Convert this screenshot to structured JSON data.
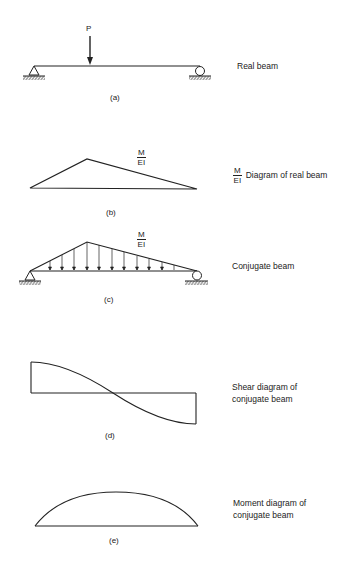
{
  "figure": {
    "panels": [
      {
        "id": "a",
        "caption": "(a)",
        "label": "Real beam",
        "load_label": "P"
      },
      {
        "id": "b",
        "caption": "(b)",
        "label_fraction": {
          "numerator": "M",
          "denominator": "EI"
        },
        "label": "Diagram of real beam",
        "diagram_fraction": {
          "numerator": "M",
          "denominator": "EI"
        }
      },
      {
        "id": "c",
        "caption": "(c)",
        "label": "Conjugate beam",
        "diagram_fraction": {
          "numerator": "M",
          "denominator": "EI"
        }
      },
      {
        "id": "d",
        "caption": "(d)",
        "label_line1": "Shear diagram of",
        "label_line2": "conjugate beam"
      },
      {
        "id": "e",
        "caption": "(e)",
        "label_line1": "Moment diagram of",
        "label_line2": "conjugate beam"
      }
    ],
    "stroke_color": "#1a1a1a",
    "background": "#ffffff"
  }
}
